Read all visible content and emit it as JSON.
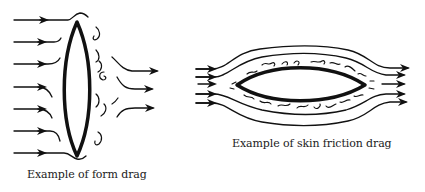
{
  "diagrams": [
    {
      "id": "form-drag",
      "caption": "Example of form drag",
      "shape": "vertical lens (flat plate broadside to flow)",
      "flow_direction": "left-to-right",
      "incoming_arrows": 7,
      "outgoing_arrows": 3,
      "wake": "turbulent eddies behind body"
    },
    {
      "id": "skin-friction-drag",
      "caption": "Example of skin friction drag",
      "shape": "horizontal lens (streamlined body)",
      "flow_direction": "left-to-right",
      "incoming_arrows": 5,
      "outgoing_arrows": 5,
      "wake": "thin boundary-layer eddies along surface"
    }
  ],
  "colors": {
    "stroke": "#111111",
    "background": "#ffffff"
  }
}
